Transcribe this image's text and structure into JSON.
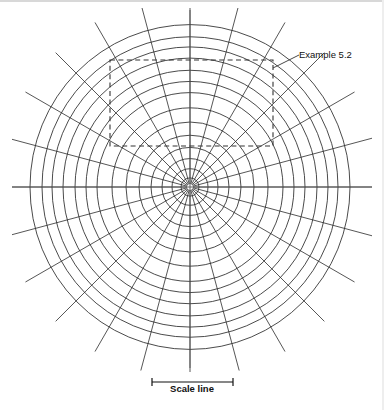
{
  "figure": {
    "title_annotation": "Example 5.2",
    "scale_label": "Scale line",
    "line_color": "#2b2b2b",
    "background_color": "#ffffff",
    "annotation_color": "#333333"
  },
  "chart_data": {
    "type": "scatter",
    "title": "",
    "subtitle": "",
    "xlabel": "",
    "ylabel": "",
    "grid": true,
    "legend_position": "none",
    "center": {
      "x": 190,
      "y": 187
    },
    "radial_spokes": {
      "count": 24,
      "angle_step_degrees": 15,
      "angles_degrees": [
        0,
        15,
        30,
        45,
        60,
        75,
        90,
        105,
        120,
        135,
        150,
        165,
        180,
        195,
        210,
        225,
        240,
        255,
        270,
        285,
        300,
        315,
        330,
        345
      ],
      "inner_radius": 3,
      "outer_radius": 190
    },
    "rings": {
      "count": 14,
      "radii": [
        9,
        18,
        28,
        39,
        51,
        64,
        78,
        93,
        104,
        115,
        127,
        138,
        148,
        160
      ],
      "outer_ring_radius": 160
    },
    "highlight_box": {
      "label": "Example 5.2",
      "style": "dashed",
      "x": 110,
      "y": 60,
      "width": 163,
      "height": 86
    },
    "leader_line": {
      "from_x": 273,
      "from_y": 68,
      "to_x": 299,
      "to_y": 55
    },
    "scale_bar": {
      "label": "Scale line",
      "x_start": 152,
      "x_end": 233,
      "y": 382,
      "tick_height": 8
    },
    "axis_lines": [
      {
        "name": "horizontal-axis",
        "x1": 12,
        "y1": 187,
        "x2": 372,
        "y2": 187
      },
      {
        "name": "vertical-axis",
        "x1": 190,
        "y1": 10,
        "x2": 190,
        "y2": 368
      }
    ]
  }
}
